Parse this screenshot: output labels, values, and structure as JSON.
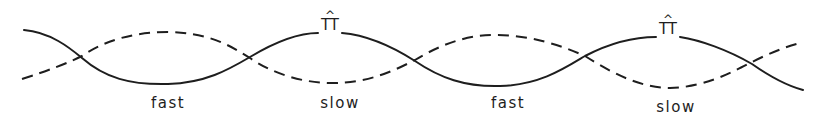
{
  "diagram": {
    "colors": {
      "line": "#1e1e1e",
      "background": "#ffffff"
    },
    "curves": [
      {
        "name": "solid-wave",
        "style": "solid",
        "path": "M 24 30 C 50 32, 70 48, 82 58 C 105 78, 130 85, 168 84 C 205 83, 228 70, 250 57 C 275 42, 300 33, 318 33 M 342 33 C 365 35, 390 45, 415 61 C 440 78, 465 87, 500 86 C 540 85, 565 68, 585 56 C 610 43, 635 37, 656 37 M 680 37 C 700 40, 728 50, 752 64 C 772 78, 788 86, 803 90"
      },
      {
        "name": "dashed-wave",
        "style": "dashed",
        "path": "M 22 79 C 50 70, 70 62, 82 56 C 105 40, 135 32, 168 32 C 205 33, 225 42, 250 58 C 270 72, 300 83, 332 83 C 370 83, 395 70, 415 60 C 440 45, 465 35, 495 35 C 530 35, 560 45, 585 56 C 610 72, 640 88, 670 88 C 705 87, 730 73, 752 62 C 770 53, 785 47, 800 43"
      }
    ],
    "labels": [
      {
        "text": "fast",
        "x": 168,
        "y": 94
      },
      {
        "text": "slow",
        "x": 340,
        "y": 94
      },
      {
        "text": "fast",
        "x": 508,
        "y": 94
      },
      {
        "text": "slow",
        "x": 676,
        "y": 98
      }
    ],
    "markers": [
      {
        "hat": "^",
        "glyph": "TT",
        "x": 330,
        "y": 10
      },
      {
        "hat": "^",
        "glyph": "TT",
        "x": 668,
        "y": 14
      }
    ]
  }
}
